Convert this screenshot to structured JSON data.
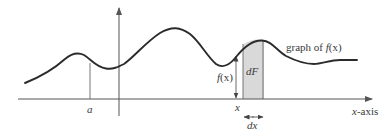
{
  "diagram": {
    "type": "area-under-curve",
    "curve_label": "graph of f(x)",
    "curve_label_parts": {
      "prefix": "graph of ",
      "func": "f",
      "arg": "(x)"
    },
    "x_axis_label": "x-axis",
    "x_axis_label_parts": {
      "var": "x",
      "suffix": "-axis"
    },
    "point_a_label": "a",
    "point_x_label": "x",
    "height_label": "f(x)",
    "height_label_parts": {
      "func": "f",
      "arg": "(x)"
    },
    "strip_label": "dF",
    "width_label": "dx",
    "colors": {
      "curve": "#2b2b2b",
      "axes": "#555555",
      "strip_fill": "#d9d9d9",
      "strip_edge": "#666666",
      "text": "#3a3a3a"
    }
  }
}
